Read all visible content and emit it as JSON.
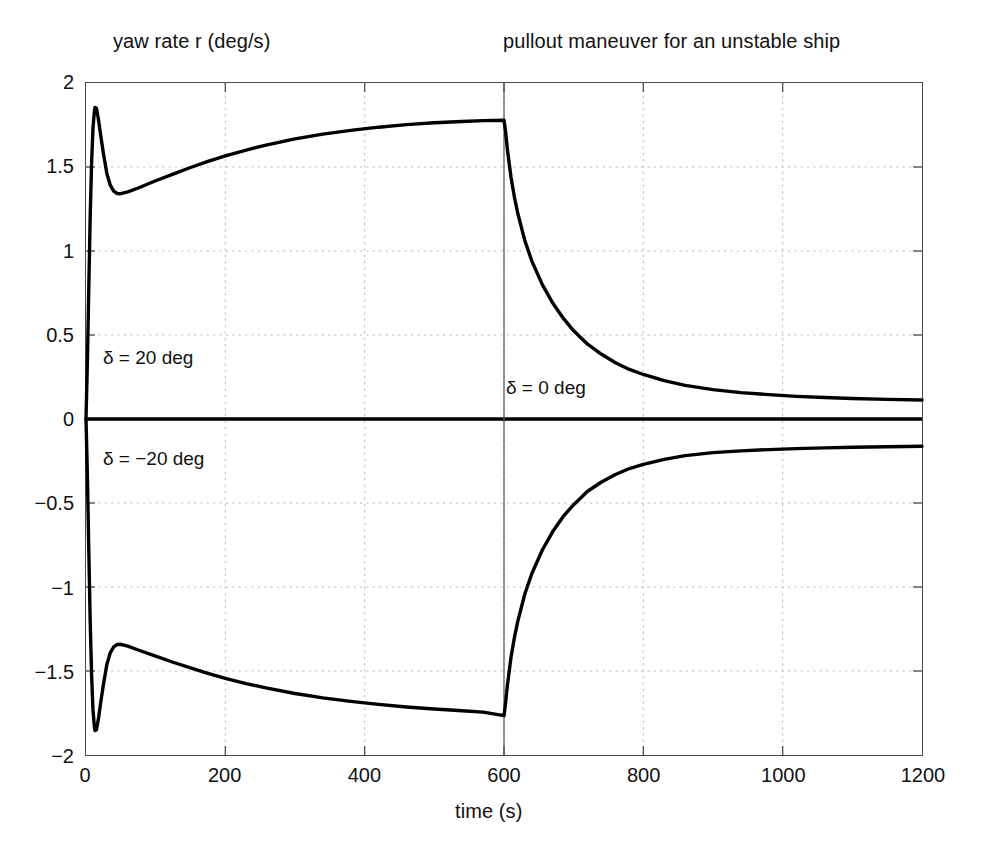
{
  "chart_data": {
    "type": "line",
    "title": "pullout maneuver for an unstable ship",
    "ylabel": "yaw rate r (deg/s)",
    "xlabel": "time (s)",
    "xlim": [
      0,
      1200
    ],
    "ylim": [
      -2,
      2
    ],
    "xticks": [
      0,
      200,
      400,
      600,
      800,
      1000,
      1200
    ],
    "xtick_labels": [
      "0",
      "200",
      "400",
      "600",
      "800",
      "1000",
      "1200"
    ],
    "yticks": [
      2,
      1.5,
      1,
      0.5,
      0,
      -0.5,
      -1,
      -1.5,
      -2
    ],
    "ytick_labels": [
      "2",
      "1.5",
      "1",
      "0.5",
      "0",
      "-0.5",
      "-1",
      "-1.5",
      "-2"
    ],
    "grid": true,
    "grid_style": "dotted",
    "grid_color": "#b9b9b9",
    "line_color": "#000000",
    "line_width": 3.4,
    "legend": null,
    "annotations": [
      {
        "text": "δ = 20 deg",
        "x": 30,
        "y": 0.44
      },
      {
        "text": "δ = −20 deg",
        "x": 30,
        "y": -0.16
      },
      {
        "text": "δ = 0 deg",
        "x": 615,
        "y": 0.1
      }
    ],
    "reference_lines": [
      {
        "orientation": "horizontal",
        "value": 0,
        "color": "#000000",
        "width": 3.4
      },
      {
        "orientation": "vertical",
        "value": 600,
        "color": "#555555",
        "width": 1.2
      }
    ],
    "series": [
      {
        "name": "positive rudder branch",
        "comment": "delta = +20 deg for t<600 then delta = 0",
        "points": [
          [
            0,
            0.0
          ],
          [
            2,
            0.34
          ],
          [
            4,
            0.78
          ],
          [
            6,
            1.2
          ],
          [
            8,
            1.52
          ],
          [
            10,
            1.73
          ],
          [
            12,
            1.83
          ],
          [
            13,
            1.855
          ],
          [
            15,
            1.85
          ],
          [
            18,
            1.78
          ],
          [
            21,
            1.69
          ],
          [
            25,
            1.58
          ],
          [
            30,
            1.46
          ],
          [
            35,
            1.39
          ],
          [
            40,
            1.355
          ],
          [
            45,
            1.342
          ],
          [
            50,
            1.341
          ],
          [
            60,
            1.352
          ],
          [
            75,
            1.375
          ],
          [
            100,
            1.418
          ],
          [
            125,
            1.458
          ],
          [
            150,
            1.497
          ],
          [
            175,
            1.533
          ],
          [
            200,
            1.566
          ],
          [
            230,
            1.601
          ],
          [
            260,
            1.632
          ],
          [
            300,
            1.667
          ],
          [
            340,
            1.696
          ],
          [
            380,
            1.718
          ],
          [
            420,
            1.737
          ],
          [
            460,
            1.752
          ],
          [
            500,
            1.763
          ],
          [
            540,
            1.771
          ],
          [
            570,
            1.776
          ],
          [
            600,
            1.778
          ],
          [
            602,
            1.72
          ],
          [
            605,
            1.6
          ],
          [
            610,
            1.44
          ],
          [
            615,
            1.32
          ],
          [
            620,
            1.22
          ],
          [
            630,
            1.06
          ],
          [
            640,
            0.94
          ],
          [
            655,
            0.8
          ],
          [
            670,
            0.69
          ],
          [
            685,
            0.6
          ],
          [
            700,
            0.525
          ],
          [
            720,
            0.445
          ],
          [
            740,
            0.385
          ],
          [
            760,
            0.335
          ],
          [
            780,
            0.295
          ],
          [
            800,
            0.265
          ],
          [
            830,
            0.228
          ],
          [
            860,
            0.2
          ],
          [
            900,
            0.175
          ],
          [
            940,
            0.157
          ],
          [
            980,
            0.145
          ],
          [
            1020,
            0.135
          ],
          [
            1060,
            0.128
          ],
          [
            1100,
            0.122
          ],
          [
            1150,
            0.117
          ],
          [
            1200,
            0.113
          ]
        ]
      },
      {
        "name": "negative rudder branch",
        "comment": "delta = -20 deg for t<600 then delta = 0",
        "points": [
          [
            0,
            0.0
          ],
          [
            2,
            -0.34
          ],
          [
            4,
            -0.78
          ],
          [
            6,
            -1.2
          ],
          [
            8,
            -1.52
          ],
          [
            10,
            -1.73
          ],
          [
            12,
            -1.83
          ],
          [
            13,
            -1.855
          ],
          [
            15,
            -1.85
          ],
          [
            18,
            -1.78
          ],
          [
            21,
            -1.69
          ],
          [
            25,
            -1.58
          ],
          [
            30,
            -1.46
          ],
          [
            35,
            -1.39
          ],
          [
            40,
            -1.355
          ],
          [
            45,
            -1.342
          ],
          [
            50,
            -1.341
          ],
          [
            60,
            -1.352
          ],
          [
            75,
            -1.375
          ],
          [
            100,
            -1.412
          ],
          [
            125,
            -1.448
          ],
          [
            150,
            -1.482
          ],
          [
            175,
            -1.514
          ],
          [
            200,
            -1.544
          ],
          [
            230,
            -1.575
          ],
          [
            260,
            -1.602
          ],
          [
            300,
            -1.634
          ],
          [
            340,
            -1.66
          ],
          [
            380,
            -1.681
          ],
          [
            420,
            -1.699
          ],
          [
            460,
            -1.714
          ],
          [
            500,
            -1.726
          ],
          [
            540,
            -1.737
          ],
          [
            570,
            -1.745
          ],
          [
            600,
            -1.766
          ],
          [
            602,
            -1.7
          ],
          [
            605,
            -1.58
          ],
          [
            610,
            -1.42
          ],
          [
            615,
            -1.3
          ],
          [
            620,
            -1.2
          ],
          [
            630,
            -1.04
          ],
          [
            640,
            -0.92
          ],
          [
            655,
            -0.78
          ],
          [
            670,
            -0.67
          ],
          [
            685,
            -0.58
          ],
          [
            700,
            -0.51
          ],
          [
            720,
            -0.43
          ],
          [
            740,
            -0.375
          ],
          [
            760,
            -0.33
          ],
          [
            780,
            -0.295
          ],
          [
            800,
            -0.27
          ],
          [
            830,
            -0.24
          ],
          [
            860,
            -0.218
          ],
          [
            900,
            -0.2
          ],
          [
            940,
            -0.19
          ],
          [
            980,
            -0.182
          ],
          [
            1020,
            -0.176
          ],
          [
            1060,
            -0.172
          ],
          [
            1100,
            -0.168
          ],
          [
            1150,
            -0.165
          ],
          [
            1200,
            -0.162
          ]
        ]
      }
    ]
  }
}
